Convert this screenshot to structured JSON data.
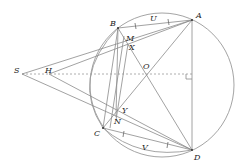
{
  "diagram": {
    "type": "geometry",
    "circle": {
      "cx": 162,
      "cy": 85,
      "r": 72
    },
    "points": [
      {
        "name": "A",
        "x": 192,
        "y": 20,
        "lx": 196,
        "ly": 18
      },
      {
        "name": "B",
        "x": 118,
        "y": 28,
        "lx": 110,
        "ly": 26
      },
      {
        "name": "C",
        "x": 103,
        "y": 128,
        "lx": 94,
        "ly": 135
      },
      {
        "name": "D",
        "x": 192,
        "y": 150,
        "lx": 194,
        "ly": 160
      },
      {
        "name": "S",
        "x": 22,
        "y": 74,
        "lx": 14,
        "ly": 73
      },
      {
        "name": "H",
        "x": 49,
        "y": 74,
        "lx": 45,
        "ly": 73
      },
      {
        "name": "O",
        "x": 143,
        "y": 72,
        "lx": 144,
        "ly": 70
      },
      {
        "name": "M",
        "x": 124,
        "y": 36,
        "lx": 126,
        "ly": 41
      },
      {
        "name": "X",
        "x": 127,
        "y": 44,
        "lx": 129,
        "ly": 50
      },
      {
        "name": "Y",
        "x": 120,
        "y": 110,
        "lx": 122,
        "ly": 112
      },
      {
        "name": "N",
        "x": 116,
        "y": 117,
        "lx": 115,
        "ly": 124
      },
      {
        "name": "U",
        "x": 155,
        "y": 22,
        "lx": 150,
        "ly": 21
      },
      {
        "name": "V",
        "x": 145,
        "y": 142,
        "lx": 142,
        "ly": 150
      }
    ],
    "labels": [
      "A",
      "B",
      "C",
      "D",
      "S",
      "H",
      "O",
      "M",
      "X",
      "Y",
      "N",
      "U",
      "V"
    ]
  }
}
